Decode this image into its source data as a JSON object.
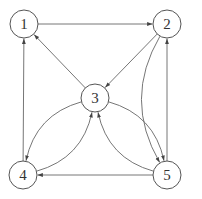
{
  "graph": {
    "directed": true,
    "nodes": [
      {
        "id": "1",
        "label": "1"
      },
      {
        "id": "2",
        "label": "2"
      },
      {
        "id": "3",
        "label": "3"
      },
      {
        "id": "4",
        "label": "4"
      },
      {
        "id": "5",
        "label": "5"
      }
    ],
    "edges": [
      {
        "from": "1",
        "to": "2",
        "style": "straight"
      },
      {
        "from": "2",
        "to": "3",
        "style": "straight"
      },
      {
        "from": "3",
        "to": "1",
        "style": "straight"
      },
      {
        "from": "4",
        "to": "1",
        "style": "straight"
      },
      {
        "from": "5",
        "to": "4",
        "style": "straight"
      },
      {
        "from": "5",
        "to": "2",
        "style": "straight"
      },
      {
        "from": "2",
        "to": "5",
        "style": "curved"
      },
      {
        "from": "4",
        "to": "3",
        "style": "curved"
      },
      {
        "from": "3",
        "to": "4",
        "style": "curved"
      },
      {
        "from": "3",
        "to": "5",
        "style": "curved"
      },
      {
        "from": "5",
        "to": "3",
        "style": "curved"
      }
    ]
  },
  "colors": {
    "stroke": "#555555",
    "edge": "#666666",
    "label": "#333333",
    "background": "#ffffff"
  }
}
